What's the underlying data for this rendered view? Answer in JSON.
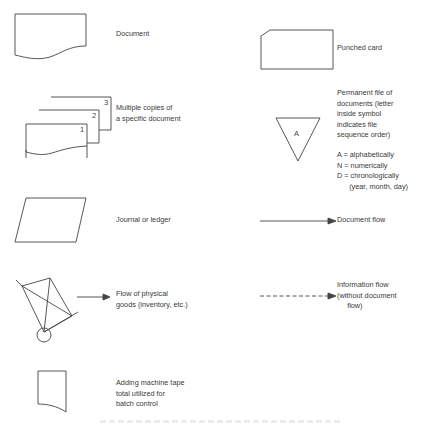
{
  "legend": {
    "left_column": [
      {
        "symbol": "document-icon",
        "label": "Document"
      },
      {
        "symbol": "multiple-copies-icon",
        "label": "Multiple copies of\na specific document",
        "copy_numbers": [
          "1",
          "2",
          "3"
        ]
      },
      {
        "symbol": "journal-ledger-icon",
        "label": "Journal or ledger"
      },
      {
        "symbol": "hand-truck-icon",
        "label": "Flow of physical\ngoods (inventory, etc.)"
      },
      {
        "symbol": "adding-machine-tape-icon",
        "label": "Adding machine tape\ntotal utilized for\nbatch control"
      }
    ],
    "right_column": [
      {
        "symbol": "punched-card-icon",
        "label": "Punched card"
      },
      {
        "symbol": "permanent-file-icon",
        "label": "Permanent file of\ndocuments (letter\ninside symbol\nindicates file\nsequence order)",
        "file_letter": "A",
        "key": "A = alphabetically\nN = numerically\nD = chronologically\n      (year, month, day)"
      },
      {
        "symbol": "document-flow-arrow-icon",
        "label": "Document flow"
      },
      {
        "symbol": "information-flow-arrow-icon",
        "label": "Information flow\n(without document\n     flow)"
      }
    ]
  },
  "colors": {
    "line": "#444444",
    "text": "#3a3a3a",
    "background": "#ffffff"
  }
}
